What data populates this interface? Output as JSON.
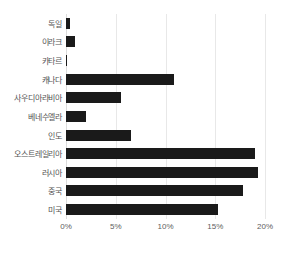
{
  "chart_data": {
    "type": "bar",
    "orientation": "horizontal",
    "title": "",
    "xlabel": "",
    "ylabel": "",
    "categories": [
      "독일",
      "이라크",
      "카타르",
      "캐나다",
      "사우디아라비아",
      "베네수엘라",
      "인도",
      "오스트레일리아",
      "러시아",
      "중국",
      "미국"
    ],
    "values": [
      0.4,
      0.9,
      0.05,
      10.9,
      5.5,
      2.0,
      6.5,
      19.0,
      19.3,
      17.8,
      15.3
    ],
    "xlim": [
      0,
      20
    ],
    "xticks": [
      0,
      5,
      10,
      15,
      20
    ],
    "xtick_labels": [
      "0%",
      "5%",
      "10%",
      "15%",
      "20%"
    ],
    "grid": true,
    "grid_axis": "x",
    "legend": false,
    "bar_color": "#1a1a1a",
    "gridline_color": "#e8e8e8",
    "background_color": "#ffffff",
    "label_color": "#555555"
  }
}
